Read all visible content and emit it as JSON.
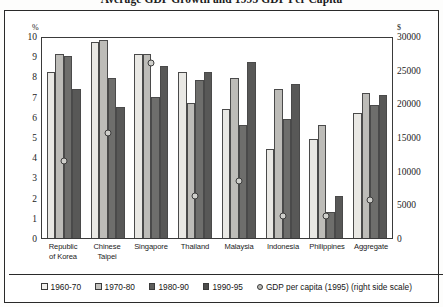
{
  "chart_data": {
    "type": "bar",
    "title": "Average GDP Growth and 1995 GDP Per Capita",
    "xlabel": "",
    "ylabel": "%",
    "y2label": "$",
    "ylim": [
      0,
      10
    ],
    "y2lim": [
      0,
      30000
    ],
    "grid": false,
    "legend_position": "bottom",
    "categories": [
      "Republic of Korea",
      "Chinese Taipei",
      "Singapore",
      "Thailand",
      "Malaysia",
      "Indonesia",
      "Philippines",
      "Aggregate"
    ],
    "category_lines": [
      [
        "Republic",
        "of Korea"
      ],
      [
        "Chinese",
        "Taipei"
      ],
      [
        "Singapore"
      ],
      [
        "Thailand"
      ],
      [
        "Malaysia"
      ],
      [
        "Indonesia"
      ],
      [
        "Philippines"
      ],
      [
        "Aggregate"
      ]
    ],
    "yticks": [
      "0",
      "1",
      "2",
      "3",
      "4",
      "5",
      "6",
      "7",
      "8",
      "9",
      "10"
    ],
    "y2ticks": [
      "0",
      "5000",
      "10000",
      "15000",
      "20000",
      "25000",
      "30000"
    ],
    "series": [
      {
        "name": "1960-70",
        "color": "#e9e8e4",
        "axis": "left",
        "values": [
          8.2,
          9.7,
          9.1,
          8.2,
          6.4,
          4.4,
          4.9,
          6.2
        ]
      },
      {
        "name": "1970-80",
        "color": "#bdbcb8",
        "axis": "left",
        "values": [
          9.1,
          9.8,
          9.1,
          6.7,
          7.9,
          7.4,
          5.6,
          7.2
        ]
      },
      {
        "name": "1980-90",
        "color": "#6e6e6c",
        "axis": "left",
        "values": [
          9.0,
          7.9,
          7.0,
          7.8,
          5.6,
          5.9,
          1.3,
          6.6
        ]
      },
      {
        "name": "1990-95",
        "color": "#585857",
        "axis": "left",
        "values": [
          7.4,
          6.5,
          8.5,
          8.2,
          8.7,
          7.6,
          2.1,
          7.1
        ]
      }
    ],
    "marker_series": {
      "name": "GDP per capita (1995) (right side scale)",
      "axis": "right",
      "values": [
        11500,
        15600,
        26000,
        6300,
        8400,
        3300,
        3300,
        5700
      ],
      "values_left_scale": [
        3.83,
        5.2,
        8.65,
        2.1,
        2.8,
        1.1,
        1.1,
        1.9
      ]
    }
  },
  "legend": {
    "items": [
      {
        "label": "1960-70",
        "swatch": "s0"
      },
      {
        "label": "1970-80",
        "swatch": "s1"
      },
      {
        "label": "1980-90",
        "swatch": "s2"
      },
      {
        "label": "1990-95",
        "swatch": "s3"
      },
      {
        "label": "GDP per capita (1995) (right side scale)",
        "swatch": "dot"
      }
    ]
  },
  "axes": {
    "left_unit": "%",
    "right_unit": "$"
  }
}
